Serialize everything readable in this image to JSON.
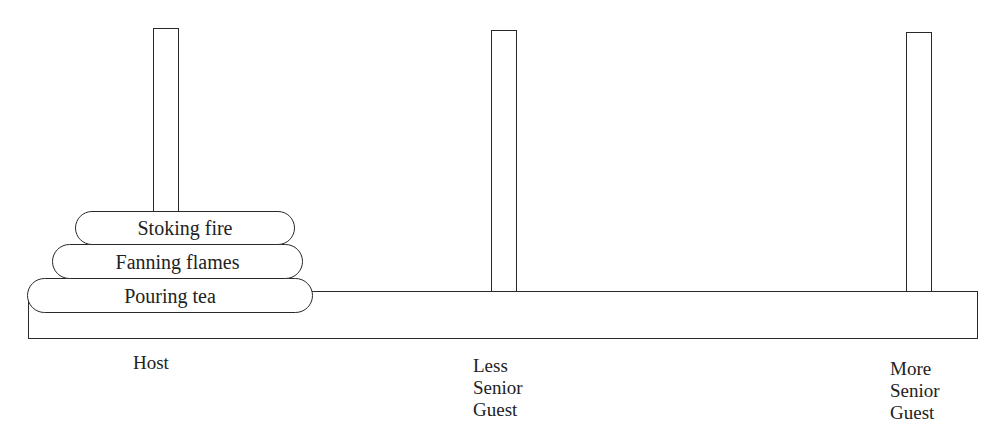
{
  "diagram": {
    "type": "tower-of-hanoi",
    "pegs": [
      {
        "id": "host",
        "label": "Host"
      },
      {
        "id": "less-senior",
        "label_lines": [
          "Less",
          "Senior",
          "Guest"
        ]
      },
      {
        "id": "more-senior",
        "label_lines": [
          "More",
          "Senior",
          "Guest"
        ]
      }
    ],
    "disks": [
      {
        "label": "Stoking fire",
        "peg": "host",
        "position": "top"
      },
      {
        "label": "Fanning flames",
        "peg": "host",
        "position": "middle"
      },
      {
        "label": "Pouring tea",
        "peg": "host",
        "position": "bottom"
      }
    ]
  }
}
